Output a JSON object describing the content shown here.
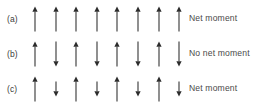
{
  "figure": {
    "background_color": "#ffffff",
    "arrow_color": "#2b2b2b",
    "text_color": "#4a4a4a",
    "width": 267,
    "height": 110
  },
  "rows": [
    {
      "label": "(a)",
      "caption": "Net moment",
      "ordering": "ferromagnetic",
      "arrow_count": 8,
      "arrows": [
        {
          "direction": "up",
          "length": "full"
        },
        {
          "direction": "up",
          "length": "full"
        },
        {
          "direction": "up",
          "length": "full"
        },
        {
          "direction": "up",
          "length": "full"
        },
        {
          "direction": "up",
          "length": "full"
        },
        {
          "direction": "up",
          "length": "full"
        },
        {
          "direction": "up",
          "length": "full"
        },
        {
          "direction": "up",
          "length": "full"
        }
      ]
    },
    {
      "label": "(b)",
      "caption": "No net moment",
      "ordering": "antiferromagnetic",
      "arrow_count": 8,
      "arrows": [
        {
          "direction": "up",
          "length": "full"
        },
        {
          "direction": "down",
          "length": "full"
        },
        {
          "direction": "up",
          "length": "full"
        },
        {
          "direction": "down",
          "length": "full"
        },
        {
          "direction": "up",
          "length": "full"
        },
        {
          "direction": "down",
          "length": "full"
        },
        {
          "direction": "up",
          "length": "full"
        },
        {
          "direction": "down",
          "length": "full"
        }
      ]
    },
    {
      "label": "(c)",
      "caption": "Net moment",
      "ordering": "ferrimagnetic",
      "arrow_count": 8,
      "arrows": [
        {
          "direction": "up",
          "length": "full"
        },
        {
          "direction": "down",
          "length": "short"
        },
        {
          "direction": "up",
          "length": "full"
        },
        {
          "direction": "down",
          "length": "short"
        },
        {
          "direction": "up",
          "length": "full"
        },
        {
          "direction": "down",
          "length": "short"
        },
        {
          "direction": "up",
          "length": "full"
        },
        {
          "direction": "down",
          "length": "short"
        }
      ]
    }
  ],
  "layout": {
    "arrow_field_left": 29,
    "arrow_spacing": 20.6,
    "full_length": 25,
    "short_length": 15
  }
}
